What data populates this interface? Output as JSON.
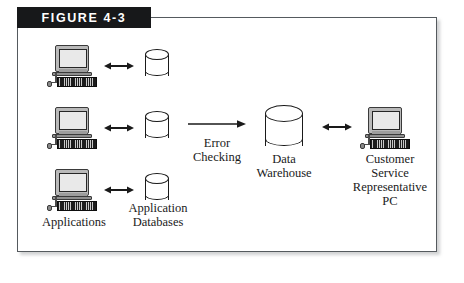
{
  "figure": {
    "header_label": "FIGURE 4-3",
    "frame_color": "#555a5e",
    "header_bg": "#17181a",
    "header_fg": "#ffffff"
  },
  "diagram": {
    "type": "data-warehouse-flow",
    "nodes": {
      "applications_label": "Applications",
      "application_databases_label": "Application\nDatabases",
      "error_checking_label": "Error\nChecking",
      "data_warehouse_label": "Data\nWarehouse",
      "csr_pc_label": "Customer\nService\nRepresentative\nPC"
    },
    "workstations": [
      {
        "id": "workstation-1",
        "icon": "desktop-computer-icon"
      },
      {
        "id": "workstation-2",
        "icon": "desktop-computer-icon"
      },
      {
        "id": "workstation-3",
        "icon": "desktop-computer-icon"
      }
    ],
    "databases": [
      {
        "id": "application-database-1",
        "icon": "database-cylinder-icon"
      },
      {
        "id": "application-database-2",
        "icon": "database-cylinder-icon"
      },
      {
        "id": "application-database-3",
        "icon": "database-cylinder-icon"
      }
    ],
    "connectors": [
      {
        "id": "ws1-db1",
        "kind": "bidirectional-arrow"
      },
      {
        "id": "ws2-db2",
        "kind": "bidirectional-arrow"
      },
      {
        "id": "ws3-db3",
        "kind": "bidirectional-arrow"
      },
      {
        "id": "databases-to-warehouse",
        "kind": "right-arrow",
        "label": "Error\nChecking"
      },
      {
        "id": "warehouse-to-csr",
        "kind": "bidirectional-arrow"
      }
    ],
    "data_warehouse": {
      "id": "data-warehouse",
      "icon": "database-cylinder-icon"
    },
    "csr_pc": {
      "id": "customer-service-pc",
      "icon": "desktop-computer-icon"
    }
  }
}
